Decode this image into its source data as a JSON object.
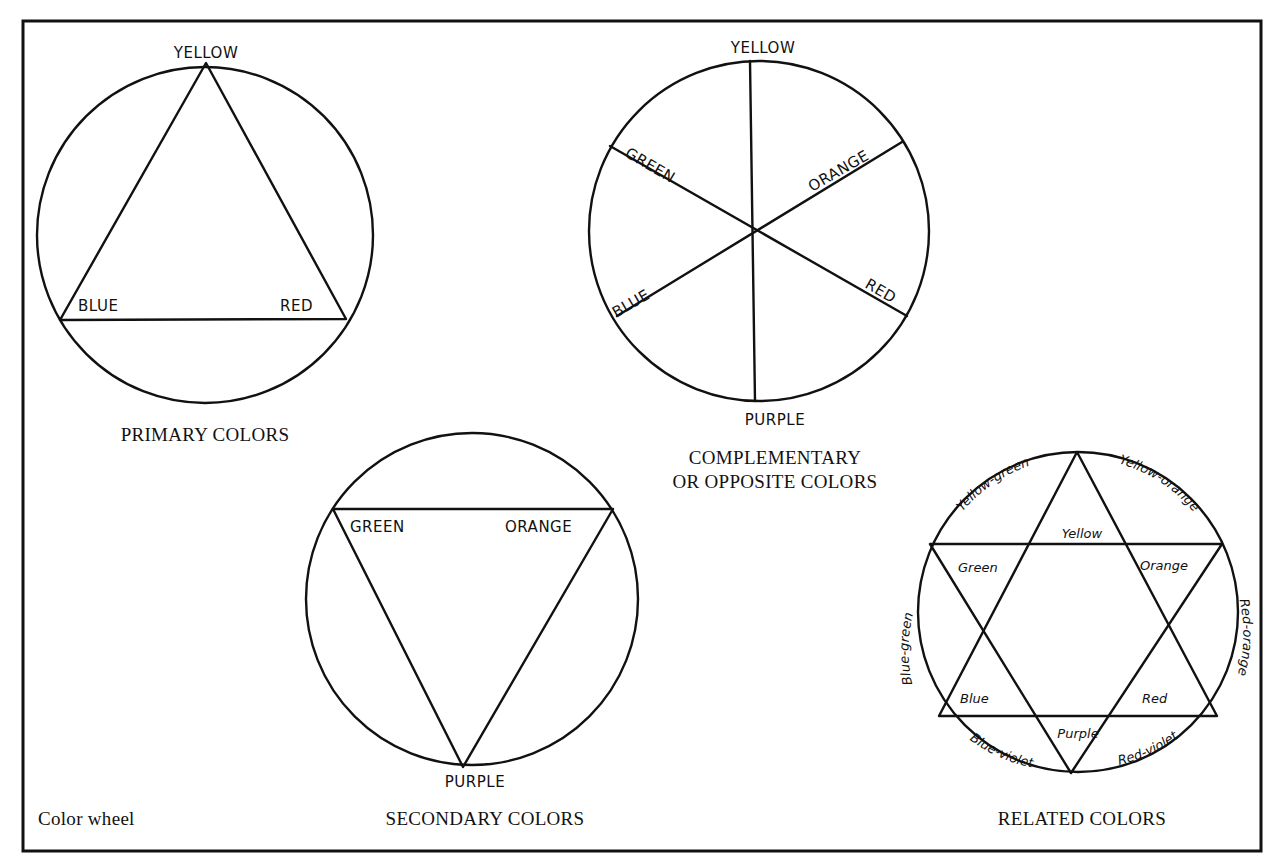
{
  "figure": {
    "title": "Color wheel",
    "frame_color": "#111111",
    "background": "#ffffff"
  },
  "wheels": {
    "primary": {
      "caption": "PRIMARY COLORS",
      "labels": {
        "top": "YELLOW",
        "left": "BLUE",
        "right": "RED"
      }
    },
    "complementary": {
      "caption_line1": "COMPLEMENTARY",
      "caption_line2": "OR OPPOSITE COLORS",
      "labels": {
        "top": "YELLOW",
        "upper_left": "GREEN",
        "upper_right": "ORANGE",
        "lower_left": "BLUE",
        "lower_right": "RED",
        "bottom": "PURPLE"
      }
    },
    "secondary": {
      "caption": "SECONDARY COLORS",
      "labels": {
        "left": "GREEN",
        "right": "ORANGE",
        "bottom": "PURPLE"
      }
    },
    "related": {
      "caption": "RELATED COLORS",
      "inner_labels": {
        "yellow": "Yellow",
        "green": "Green",
        "orange": "Orange",
        "blue": "Blue",
        "red": "Red",
        "purple": "Purple"
      },
      "outer_labels": {
        "yellow_green": "Yellow-green",
        "yellow_orange": "Yellow-orange",
        "red_orange": "Red-orange",
        "red_violet": "Red-violet",
        "blue_violet": "Blue-violet",
        "blue_green": "Blue-green"
      }
    }
  }
}
